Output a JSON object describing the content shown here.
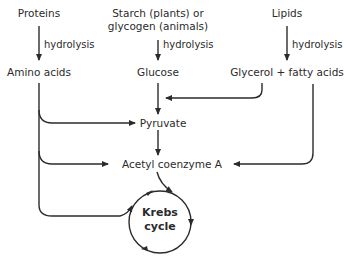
{
  "diagram": {
    "sources": {
      "proteins": "Proteins",
      "starch_line1": "Starch (plants) or",
      "starch_line2": "glycogen (animals)",
      "lipids": "Lipids"
    },
    "process_label": "hydrolysis",
    "products": {
      "amino_acids": "Amino acids",
      "glucose": "Glucose",
      "glycerol_fatty_acids": "Glycerol + fatty acids"
    },
    "intermediates": {
      "pyruvate": "Pyruvate",
      "acetyl_coa": "Acetyl coenzyme A"
    },
    "cycle": {
      "line1": "Krebs",
      "line2": "cycle"
    },
    "colors": {
      "stroke": "#2b2b2b",
      "text": "#2b2b2b",
      "background": "#ffffff"
    }
  }
}
